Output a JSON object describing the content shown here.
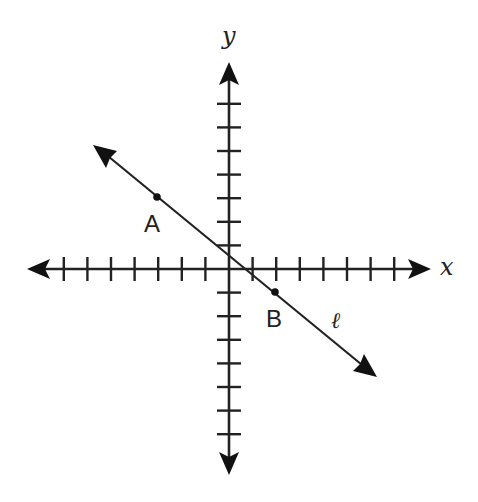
{
  "diagram": {
    "type": "coordinate-plane",
    "axes": {
      "x_label": "x",
      "y_label": "y",
      "x_ticks": [
        -7,
        -6,
        -5,
        -4,
        -3,
        -2,
        -1,
        1,
        2,
        3,
        4,
        5,
        6,
        7
      ],
      "y_ticks": [
        -7,
        -6,
        -5,
        -4,
        -3,
        -2,
        -1,
        1,
        2,
        3,
        4,
        5,
        6,
        7
      ],
      "tick_labels_shown": false,
      "color": "#222222"
    },
    "line": {
      "label": "ℓ",
      "direction": "decreasing",
      "arrows_both_ends": true
    },
    "points": [
      {
        "label": "A",
        "x": -3,
        "y": 3
      },
      {
        "label": "B",
        "x": 2,
        "y": -1
      }
    ]
  }
}
